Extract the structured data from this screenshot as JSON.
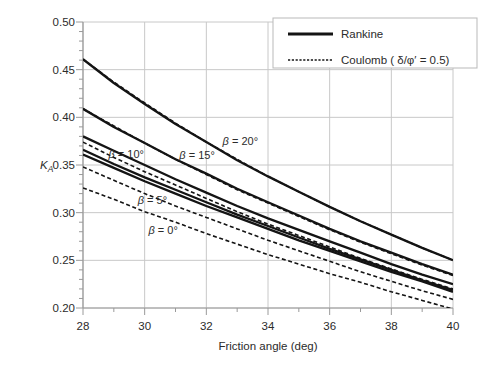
{
  "figure": {
    "background": "#ffffff",
    "curve_color": "#141414",
    "grid_color": "#c8c8c8",
    "axis_color": "#9a9a9a",
    "text_color": "#2b2b2b",
    "legend_border_color": "#b9b9b9"
  },
  "chart_data": {
    "type": "line",
    "title": "",
    "xlabel": "Friction angle (deg)",
    "ylabel": "K_A",
    "ylabel_main": "K",
    "ylabel_sub": "A",
    "xlim": [
      28,
      40
    ],
    "ylim": [
      0.2,
      0.5
    ],
    "grid": true,
    "x_major_ticks": [
      "28",
      "30",
      "32",
      "34",
      "36",
      "38",
      "40"
    ],
    "x_minor_step": 1,
    "y_major_ticks": [
      "0.50",
      "0.45",
      "0.40",
      "0.35",
      "0.30",
      "0.25",
      "0.20"
    ],
    "y_minor_step": 0.01,
    "x": [
      28,
      29,
      30,
      31,
      32,
      33,
      34,
      35,
      36,
      37,
      38,
      39,
      40
    ],
    "series": [
      {
        "name": "Rankine β = 0°",
        "group": "Rankine",
        "beta": 0,
        "line_style": "solid",
        "values": [
          0.361,
          0.347,
          0.333,
          0.32,
          0.307,
          0.295,
          0.283,
          0.271,
          0.26,
          0.249,
          0.238,
          0.228,
          0.217
        ]
      },
      {
        "name": "Rankine β = 5°",
        "group": "Rankine",
        "beta": 5,
        "line_style": "solid",
        "values": [
          0.366,
          0.351,
          0.337,
          0.324,
          0.311,
          0.298,
          0.286,
          0.274,
          0.262,
          0.251,
          0.24,
          0.229,
          0.219
        ]
      },
      {
        "name": "Rankine β = 10°",
        "group": "Rankine",
        "beta": 10,
        "line_style": "solid",
        "values": [
          0.38,
          0.365,
          0.35,
          0.335,
          0.321,
          0.307,
          0.294,
          0.282,
          0.27,
          0.258,
          0.246,
          0.235,
          0.225
        ]
      },
      {
        "name": "Rankine β = 15°",
        "group": "Rankine",
        "beta": 15,
        "line_style": "solid",
        "values": [
          0.409,
          0.39,
          0.373,
          0.356,
          0.341,
          0.325,
          0.311,
          0.297,
          0.283,
          0.27,
          0.258,
          0.246,
          0.235
        ]
      },
      {
        "name": "Rankine β = 20°",
        "group": "Rankine",
        "beta": 20,
        "line_style": "solid",
        "values": [
          0.461,
          0.436,
          0.414,
          0.393,
          0.374,
          0.355,
          0.338,
          0.322,
          0.306,
          0.291,
          0.277,
          0.263,
          0.25
        ]
      },
      {
        "name": "Coulomb β = 0°",
        "group": "Coulomb",
        "beta": 0,
        "line_style": "dashed",
        "values": [
          0.326,
          0.314,
          0.301,
          0.29,
          0.278,
          0.267,
          0.256,
          0.246,
          0.236,
          0.227,
          0.217,
          0.208,
          0.199
        ]
      },
      {
        "name": "Coulomb β = 5°",
        "group": "Coulomb",
        "beta": 5,
        "line_style": "dashed",
        "values": [
          0.348,
          0.334,
          0.32,
          0.307,
          0.295,
          0.283,
          0.271,
          0.26,
          0.249,
          0.238,
          0.228,
          0.218,
          0.209
        ]
      },
      {
        "name": "Coulomb β = 10°",
        "group": "Coulomb",
        "beta": 10,
        "line_style": "dashed",
        "values": [
          0.374,
          0.358,
          0.343,
          0.329,
          0.315,
          0.301,
          0.288,
          0.276,
          0.264,
          0.252,
          0.241,
          0.23,
          0.22
        ]
      },
      {
        "name": "Coulomb β = 15°",
        "group": "Coulomb",
        "beta": 15,
        "line_style": "dashed",
        "values": [
          0.409,
          0.391,
          0.373,
          0.356,
          0.34,
          0.324,
          0.31,
          0.296,
          0.282,
          0.269,
          0.257,
          0.245,
          0.234
        ]
      },
      {
        "name": "Coulomb β = 20°",
        "group": "Coulomb",
        "beta": 20,
        "line_style": "dashed",
        "values": [
          0.461,
          0.437,
          0.415,
          0.394,
          0.374,
          0.356,
          0.338,
          0.322,
          0.306,
          0.291,
          0.277,
          0.263,
          0.25
        ]
      }
    ],
    "legend": {
      "position": "top-right",
      "entries": [
        {
          "label": "Rankine",
          "line_style": "solid"
        },
        {
          "label": "Coulomb ( δ/φ′ = 0.5)",
          "line_style": "dashed"
        }
      ]
    },
    "annotations": [
      {
        "label": "β = 10°",
        "x": 29.4,
        "y": 0.3615
      },
      {
        "label": "β = 15°",
        "x": 31.7,
        "y": 0.3605
      },
      {
        "label": "β = 20°",
        "x": 33.1,
        "y": 0.3755
      },
      {
        "label": "β = 5°",
        "x": 30.25,
        "y": 0.3135
      },
      {
        "label": "β = 0°",
        "x": 30.6,
        "y": 0.282
      }
    ]
  }
}
